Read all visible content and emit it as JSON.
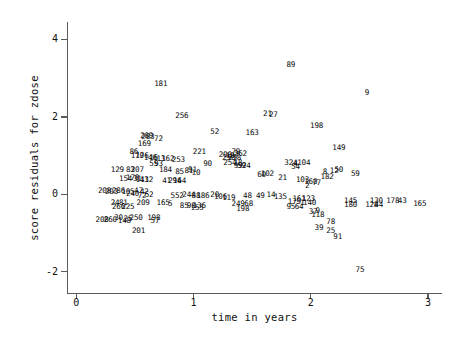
{
  "chart_data": {
    "type": "scatter",
    "title": "",
    "xlabel": "time in years",
    "ylabel": "score residuals for zdose",
    "xlim": [
      -0.08,
      3.12
    ],
    "ylim": [
      -2.55,
      4.45
    ],
    "xticks": [
      0,
      1,
      2,
      3
    ],
    "xticklabels": [
      "0",
      "1",
      "2",
      "3"
    ],
    "yticks": [
      4,
      2,
      0,
      -2
    ],
    "yticklabels": [
      "4",
      "2",
      "0",
      "-2"
    ],
    "grid": false,
    "legend": null,
    "marker_style": "observation-id-text",
    "note": "Each plotted point is drawn as its observation id number instead of a symbol.",
    "points": [
      {
        "label": "181",
        "x": 0.72,
        "y": 2.85
      },
      {
        "label": "89",
        "x": 1.83,
        "y": 3.35
      },
      {
        "label": "9",
        "x": 2.48,
        "y": 2.62
      },
      {
        "label": "256",
        "x": 0.9,
        "y": 2.03
      },
      {
        "label": "21",
        "x": 1.63,
        "y": 2.08
      },
      {
        "label": "27",
        "x": 1.68,
        "y": 2.06
      },
      {
        "label": "198",
        "x": 2.05,
        "y": 1.77
      },
      {
        "label": "52",
        "x": 1.18,
        "y": 1.62
      },
      {
        "label": "163",
        "x": 1.5,
        "y": 1.58
      },
      {
        "label": "289",
        "x": 0.6,
        "y": 1.5
      },
      {
        "label": "283",
        "x": 0.61,
        "y": 1.47
      },
      {
        "label": "72",
        "x": 0.7,
        "y": 1.44
      },
      {
        "label": "169",
        "x": 0.58,
        "y": 1.3
      },
      {
        "label": "149",
        "x": 2.24,
        "y": 1.2
      },
      {
        "label": "86",
        "x": 0.49,
        "y": 1.08
      },
      {
        "label": "221",
        "x": 1.05,
        "y": 1.08
      },
      {
        "label": "200",
        "x": 1.27,
        "y": 1.02
      },
      {
        "label": "79",
        "x": 1.36,
        "y": 1.1
      },
      {
        "label": "262",
        "x": 1.4,
        "y": 1.05
      },
      {
        "label": "187",
        "x": 1.33,
        "y": 1.0
      },
      {
        "label": "170",
        "x": 0.52,
        "y": 0.98
      },
      {
        "label": "176",
        "x": 0.56,
        "y": 0.98
      },
      {
        "label": "146",
        "x": 0.63,
        "y": 0.93
      },
      {
        "label": "16",
        "x": 0.66,
        "y": 0.93
      },
      {
        "label": "13",
        "x": 0.72,
        "y": 0.9
      },
      {
        "label": "162",
        "x": 0.78,
        "y": 0.9
      },
      {
        "label": "253",
        "x": 0.87,
        "y": 0.88
      },
      {
        "label": "250",
        "x": 1.3,
        "y": 0.95
      },
      {
        "label": "258",
        "x": 1.35,
        "y": 0.93
      },
      {
        "label": "18",
        "x": 1.38,
        "y": 0.82
      },
      {
        "label": "254",
        "x": 1.31,
        "y": 0.8
      },
      {
        "label": "59",
        "x": 1.41,
        "y": 0.74
      },
      {
        "label": "99",
        "x": 1.38,
        "y": 0.72
      },
      {
        "label": "24",
        "x": 1.45,
        "y": 0.72
      },
      {
        "label": "324",
        "x": 1.83,
        "y": 0.8
      },
      {
        "label": "4",
        "x": 1.87,
        "y": 0.78
      },
      {
        "label": "104",
        "x": 1.94,
        "y": 0.8
      },
      {
        "label": "54",
        "x": 1.87,
        "y": 0.7
      },
      {
        "label": "90",
        "x": 1.12,
        "y": 0.78
      },
      {
        "label": "55",
        "x": 0.66,
        "y": 0.78
      },
      {
        "label": "93",
        "x": 0.7,
        "y": 0.77
      },
      {
        "label": "129",
        "x": 0.35,
        "y": 0.62
      },
      {
        "label": "83",
        "x": 0.46,
        "y": 0.62
      },
      {
        "label": "207",
        "x": 0.52,
        "y": 0.63
      },
      {
        "label": "184",
        "x": 0.76,
        "y": 0.62
      },
      {
        "label": "85",
        "x": 0.88,
        "y": 0.58
      },
      {
        "label": "81",
        "x": 0.96,
        "y": 0.6
      },
      {
        "label": "91",
        "x": 0.99,
        "y": 0.62
      },
      {
        "label": "10",
        "x": 1.02,
        "y": 0.56
      },
      {
        "label": "8",
        "x": 2.12,
        "y": 0.58
      },
      {
        "label": "12",
        "x": 2.2,
        "y": 0.6
      },
      {
        "label": "50",
        "x": 2.24,
        "y": 0.64
      },
      {
        "label": "59b",
        "x": 2.38,
        "y": 0.52
      },
      {
        "label": "102",
        "x": 1.63,
        "y": 0.52
      },
      {
        "label": "60",
        "x": 1.58,
        "y": 0.5
      },
      {
        "label": "21b",
        "x": 1.76,
        "y": 0.42
      },
      {
        "label": "182",
        "x": 2.14,
        "y": 0.44
      },
      {
        "label": "103",
        "x": 1.93,
        "y": 0.38
      },
      {
        "label": "154",
        "x": 0.42,
        "y": 0.4
      },
      {
        "label": "170b",
        "x": 0.48,
        "y": 0.42
      },
      {
        "label": "31",
        "x": 0.52,
        "y": 0.4
      },
      {
        "label": "143",
        "x": 0.56,
        "y": 0.38
      },
      {
        "label": "112",
        "x": 0.6,
        "y": 0.36
      },
      {
        "label": "294",
        "x": 0.84,
        "y": 0.34
      },
      {
        "label": "164",
        "x": 0.88,
        "y": 0.34
      },
      {
        "label": "41",
        "x": 0.77,
        "y": 0.34
      },
      {
        "label": "77",
        "x": 2.05,
        "y": 0.28
      },
      {
        "label": "160",
        "x": 2.0,
        "y": 0.32
      },
      {
        "label": "2",
        "x": 1.97,
        "y": 0.22
      },
      {
        "label": "208",
        "x": 0.24,
        "y": 0.08
      },
      {
        "label": "203",
        "x": 0.3,
        "y": 0.06
      },
      {
        "label": "286",
        "x": 0.36,
        "y": 0.08
      },
      {
        "label": "105",
        "x": 0.44,
        "y": 0.06
      },
      {
        "label": "47",
        "x": 0.53,
        "y": 0.08
      },
      {
        "label": "42",
        "x": 0.58,
        "y": 0.06
      },
      {
        "label": "240",
        "x": 0.48,
        "y": 0.0
      },
      {
        "label": "52b",
        "x": 0.62,
        "y": -0.02
      },
      {
        "label": "72b",
        "x": 0.56,
        "y": -0.04
      },
      {
        "label": "552",
        "x": 0.86,
        "y": -0.04
      },
      {
        "label": "244",
        "x": 0.96,
        "y": -0.02
      },
      {
        "label": "88",
        "x": 1.02,
        "y": -0.04
      },
      {
        "label": "186",
        "x": 1.08,
        "y": -0.04
      },
      {
        "label": "20",
        "x": 1.18,
        "y": -0.02
      },
      {
        "label": "106",
        "x": 1.23,
        "y": -0.06
      },
      {
        "label": "119",
        "x": 1.3,
        "y": -0.1
      },
      {
        "label": "48",
        "x": 1.46,
        "y": -0.04
      },
      {
        "label": "49",
        "x": 1.57,
        "y": -0.04
      },
      {
        "label": "14",
        "x": 1.66,
        "y": -0.02
      },
      {
        "label": "135",
        "x": 1.74,
        "y": -0.06
      },
      {
        "label": "161",
        "x": 1.9,
        "y": -0.12
      },
      {
        "label": "123",
        "x": 1.98,
        "y": -0.12
      },
      {
        "label": "179",
        "x": 1.86,
        "y": -0.2
      },
      {
        "label": "1",
        "x": 1.93,
        "y": -0.22
      },
      {
        "label": "140",
        "x": 1.99,
        "y": -0.22
      },
      {
        "label": "24b",
        "x": 0.33,
        "y": -0.22
      },
      {
        "label": "81b",
        "x": 0.4,
        "y": -0.22
      },
      {
        "label": "209",
        "x": 0.57,
        "y": -0.22
      },
      {
        "label": "165",
        "x": 0.74,
        "y": -0.22
      },
      {
        "label": "5",
        "x": 0.8,
        "y": -0.26
      },
      {
        "label": "85b",
        "x": 0.92,
        "y": -0.3
      },
      {
        "label": "98",
        "x": 0.98,
        "y": -0.3
      },
      {
        "label": "136",
        "x": 1.05,
        "y": -0.3
      },
      {
        "label": "155",
        "x": 1.03,
        "y": -0.36
      },
      {
        "label": "249",
        "x": 1.38,
        "y": -0.26
      },
      {
        "label": "68",
        "x": 1.47,
        "y": -0.26
      },
      {
        "label": "198b",
        "x": 1.42,
        "y": -0.38
      },
      {
        "label": "95",
        "x": 1.83,
        "y": -0.34
      },
      {
        "label": "64",
        "x": 1.9,
        "y": -0.34
      },
      {
        "label": "266",
        "x": 0.36,
        "y": -0.34
      },
      {
        "label": "225",
        "x": 0.44,
        "y": -0.34
      },
      {
        "label": "37",
        "x": 2.02,
        "y": -0.46
      },
      {
        "label": "9b",
        "x": 2.06,
        "y": -0.44
      },
      {
        "label": "118",
        "x": 2.06,
        "y": -0.54
      },
      {
        "label": "145",
        "x": 2.34,
        "y": -0.18
      },
      {
        "label": "130",
        "x": 2.56,
        "y": -0.18
      },
      {
        "label": "178",
        "x": 2.7,
        "y": -0.18
      },
      {
        "label": "43",
        "x": 2.78,
        "y": -0.18
      },
      {
        "label": "165b",
        "x": 2.93,
        "y": -0.26
      },
      {
        "label": "180",
        "x": 2.34,
        "y": -0.28
      },
      {
        "label": "128",
        "x": 2.52,
        "y": -0.28
      },
      {
        "label": "44",
        "x": 2.58,
        "y": -0.28
      },
      {
        "label": "208b",
        "x": 0.22,
        "y": -0.66
      },
      {
        "label": "260",
        "x": 0.29,
        "y": -0.66
      },
      {
        "label": "30",
        "x": 0.36,
        "y": -0.62
      },
      {
        "label": "25",
        "x": 0.44,
        "y": -0.64
      },
      {
        "label": "250b",
        "x": 0.51,
        "y": -0.62
      },
      {
        "label": "148",
        "x": 0.41,
        "y": -0.7
      },
      {
        "label": "198c",
        "x": 0.66,
        "y": -0.62
      },
      {
        "label": "57",
        "x": 0.67,
        "y": -0.68
      },
      {
        "label": "201",
        "x": 0.53,
        "y": -0.94
      },
      {
        "label": "78",
        "x": 2.17,
        "y": -0.72
      },
      {
        "label": "39",
        "x": 2.07,
        "y": -0.88
      },
      {
        "label": "25b",
        "x": 2.17,
        "y": -0.96
      },
      {
        "label": "91b",
        "x": 2.23,
        "y": -1.1
      },
      {
        "label": "75",
        "x": 2.42,
        "y": -1.96
      }
    ]
  }
}
